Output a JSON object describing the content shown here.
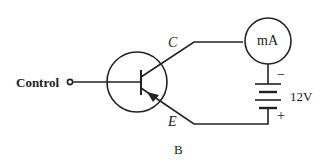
{
  "diagram": {
    "type": "transistor-circuit",
    "labels": {
      "control": "Control",
      "collector": "C",
      "emitter": "E",
      "ammeter": "mA",
      "battery_voltage": "12V",
      "battery_negative": "−",
      "battery_positive": "+",
      "caption": "B"
    },
    "components": [
      {
        "id": "transistor",
        "kind": "PNP transistor (emitter arrow pointing in)"
      },
      {
        "id": "ammeter",
        "kind": "milliammeter",
        "label": "mA"
      },
      {
        "id": "battery",
        "kind": "battery",
        "voltage": "12V"
      },
      {
        "id": "control-terminal",
        "kind": "input terminal",
        "label": "Control"
      }
    ],
    "colors": {
      "stroke": "#222222",
      "background": "#ffffff"
    }
  }
}
